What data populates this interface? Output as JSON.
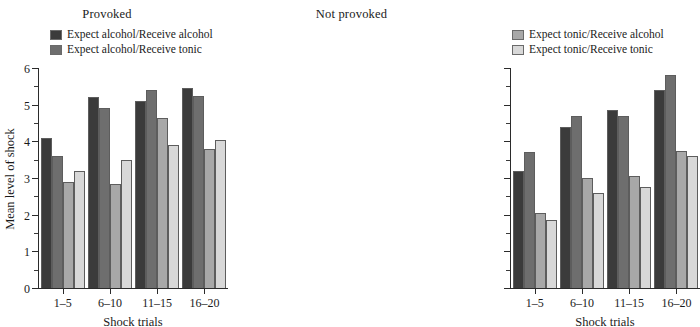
{
  "chart_data": [
    {
      "type": "bar",
      "title": "Provoked",
      "xlabel": "Shock trials",
      "ylabel": "Mean level of shock",
      "categories": [
        "1–5",
        "6–10",
        "11–15",
        "16–20"
      ],
      "ylim": [
        0,
        6
      ],
      "yticks": [
        0,
        1,
        2,
        3,
        4,
        5,
        6
      ],
      "ytick_labels": [
        "0",
        "1",
        "2",
        "3",
        "4",
        "5",
        "6"
      ],
      "minor_ytick_step": 0.5,
      "grid": false,
      "legend_position": "top-center",
      "series": [
        {
          "name": "Expect alcohol/Receive alcohol",
          "color": "#3b3b3b",
          "values": [
            4.1,
            5.2,
            5.1,
            5.45
          ]
        },
        {
          "name": "Expect alcohol/Receive tonic",
          "color": "#6e6e6e",
          "values": [
            3.6,
            4.9,
            5.4,
            5.25
          ]
        },
        {
          "name": "Expect tonic/Receive alcohol",
          "color": "#a8a8a8",
          "values": [
            2.9,
            2.85,
            4.65,
            3.8
          ]
        },
        {
          "name": "Expect tonic/Receive tonic",
          "color": "#d8d8d8",
          "values": [
            3.2,
            3.5,
            3.9,
            4.05
          ]
        }
      ]
    },
    {
      "type": "bar",
      "title": "Not provoked",
      "xlabel": "Shock trials",
      "ylabel": "",
      "categories": [
        "1–5",
        "6–10",
        "11–15",
        "16–20"
      ],
      "ylim": [
        0,
        6
      ],
      "yticks": [
        0,
        1,
        2,
        3,
        4,
        5,
        6
      ],
      "ytick_labels": [
        "",
        "",
        "",
        "",
        "",
        "",
        ""
      ],
      "minor_ytick_step": 0.5,
      "grid": false,
      "legend_position": "top-center",
      "series": [
        {
          "name": "Expect alcohol/Receive alcohol",
          "color": "#3b3b3b",
          "values": [
            3.2,
            4.4,
            4.85,
            5.4
          ]
        },
        {
          "name": "Expect alcohol/Receive tonic",
          "color": "#6e6e6e",
          "values": [
            3.7,
            4.7,
            4.7,
            5.8
          ]
        },
        {
          "name": "Expect tonic/Receive alcohol",
          "color": "#a8a8a8",
          "values": [
            2.05,
            3.0,
            3.05,
            3.75
          ]
        },
        {
          "name": "Expect tonic/Receive tonic",
          "color": "#d8d8d8",
          "values": [
            1.85,
            2.6,
            2.75,
            3.6
          ]
        }
      ]
    }
  ],
  "panels": [
    {
      "title": "Provoked",
      "legend": [
        {
          "label": "Expect alcohol/Receive alcohol",
          "color": "#3b3b3b"
        },
        {
          "label": "Expect alcohol/Receive tonic",
          "color": "#6e6e6e"
        }
      ]
    },
    {
      "title": "Not provoked",
      "legend": [
        {
          "label": "Expect tonic/Receive alcohol",
          "color": "#a8a8a8"
        },
        {
          "label": "Expect tonic/Receive tonic",
          "color": "#d8d8d8"
        }
      ]
    }
  ]
}
